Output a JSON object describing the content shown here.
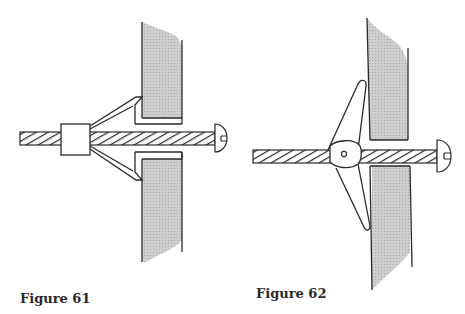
{
  "figures": [
    {
      "id": "figure-61",
      "caption": "Figure 61",
      "subject": "expansion anchor (molly bolt) set in hollow wall"
    },
    {
      "id": "figure-62",
      "caption": "Figure 62",
      "subject": "spring toggle bolt set in hollow wall"
    }
  ],
  "colors": {
    "line": "#2a2a2a",
    "wall_fill": "#c8c8c8",
    "background": "#ffffff"
  }
}
